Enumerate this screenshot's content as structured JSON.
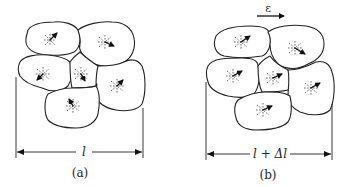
{
  "figure": {
    "panel_a": {
      "caption": "(a)",
      "dimension_label": "l",
      "grain_count": 6
    },
    "panel_b": {
      "caption": "(b)",
      "dimension_label": "l + Δl",
      "strain_label": "ε",
      "grain_count": 6
    },
    "colors": {
      "line": "#222222",
      "background": "#ffffff"
    }
  }
}
